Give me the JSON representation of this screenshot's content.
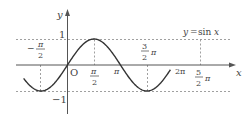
{
  "chart_data": {
    "type": "line",
    "title": "y = sin x",
    "xlabel": "x",
    "ylabel": "y",
    "function": "sin",
    "x_range": [
      -2.6,
      6.1
    ],
    "ylim": [
      -1,
      1
    ],
    "grid": false,
    "reference_lines": {
      "y": [
        1,
        -1
      ],
      "x": [
        -1.5708,
        1.5708,
        4.7124,
        7.854
      ]
    },
    "x_ticks": [
      {
        "value": -1.5708,
        "label": "-π/2"
      },
      {
        "value": 1.5708,
        "label": "π/2"
      },
      {
        "value": 3.1416,
        "label": "π"
      },
      {
        "value": 4.7124,
        "label": "3/2 π"
      },
      {
        "value": 6.2832,
        "label": "2π"
      },
      {
        "value": 7.854,
        "label": "5/2 π"
      }
    ],
    "y_ticks": [
      {
        "value": 1,
        "label": "1"
      },
      {
        "value": -1,
        "label": "-1"
      }
    ],
    "annotations": [
      "O"
    ]
  },
  "labels": {
    "curve": "y=sin x",
    "curve_y": "y",
    "curve_eq": "=",
    "curve_sin": "sin",
    "curve_x": "x",
    "axis_x": "x",
    "axis_y": "y",
    "origin": "O",
    "y_one": "1",
    "y_minus_one": "−1",
    "neg_half_pi_minus": "−",
    "pi": "π",
    "two": "2",
    "three": "3",
    "five": "5",
    "two_pi": "2π"
  },
  "colors": {
    "curve": "#333333",
    "axis": "#555555",
    "dashed": "#888888",
    "text": "#444444"
  }
}
